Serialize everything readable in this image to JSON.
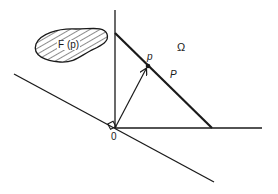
{
  "figure": {
    "type": "geometric diagram",
    "colors": {
      "stroke": "#1a1a1a",
      "background": "#ffffff"
    },
    "labels": {
      "region": "F (p)",
      "domain": "Ω",
      "point": "p",
      "line": "P",
      "origin": "0"
    },
    "elements": {
      "vertical_axis": {
        "x1": 115,
        "y1": 10,
        "x2": 115,
        "y2": 128
      },
      "horizontal_axis": {
        "x1": 115,
        "y1": 128,
        "x2": 262,
        "y2": 128
      },
      "diagonal_line": {
        "x1": 14,
        "y1": 74,
        "x2": 214,
        "y2": 182
      },
      "hyperplane_segment": {
        "x1": 115,
        "y1": 33,
        "x2": 212,
        "y2": 128
      },
      "vector_arrow": {
        "x1": 115,
        "y1": 128,
        "x2": 146,
        "y2": 68
      },
      "point_p": {
        "cx": 148,
        "cy": 66
      },
      "right_angle_marker": {
        "x": 111,
        "y": 120,
        "size": 7
      }
    }
  }
}
